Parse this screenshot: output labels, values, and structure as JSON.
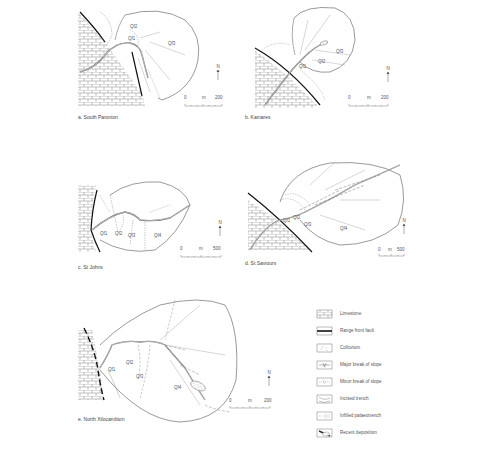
{
  "figure": {
    "panels": [
      {
        "id": "a",
        "caption": "a. South Paronion",
        "units": [
          "Qf1",
          "Qf2",
          "Qf3"
        ],
        "scale": {
          "start": "0",
          "unit": "m",
          "end": "200"
        },
        "north": "N"
      },
      {
        "id": "b",
        "caption": "b. Kamares",
        "units": [
          "Qf1",
          "Qf2",
          "Qf3"
        ],
        "scale": {
          "start": "0",
          "unit": "m",
          "end": "200"
        },
        "north": "N"
      },
      {
        "id": "c",
        "caption": "c. St Johns",
        "units": [
          "Qf1",
          "Qf2",
          "Qf3",
          "Qf4"
        ],
        "scale": {
          "start": "0",
          "unit": "m",
          "end": "500"
        },
        "north": "N"
      },
      {
        "id": "d",
        "caption": "d. St Saviours",
        "units": [
          "Qf1",
          "Qf2",
          "Qf3",
          "Qf4"
        ],
        "scale": {
          "start": "0",
          "unit": "m",
          "end": "500"
        },
        "north": "N"
      },
      {
        "id": "e",
        "caption": "e. North Xilocambion",
        "units": [
          "Qf1",
          "Qf2",
          "Qf3",
          "Qf4"
        ],
        "scale": {
          "start": "0",
          "unit": "m",
          "end": "200"
        },
        "north": "N"
      }
    ],
    "legend": [
      {
        "symbol": "limestone",
        "label": "Limestone"
      },
      {
        "symbol": "range-front-fault",
        "label": "Range front fault"
      },
      {
        "symbol": "colluvium",
        "label": "Colluvium"
      },
      {
        "symbol": "major-break-of-slope",
        "label": "Major break of slope"
      },
      {
        "symbol": "minor-break-of-slope",
        "label": "Minor break of slope"
      },
      {
        "symbol": "incised-trench",
        "label": "Incised trench"
      },
      {
        "symbol": "infilled-palaeotrench",
        "label": "Infilled palaeotrench"
      },
      {
        "symbol": "recent-deposition",
        "label": "Recent deposition"
      }
    ],
    "colors": {
      "line": "#555555",
      "fault": "#111111",
      "text": "#555555"
    }
  }
}
